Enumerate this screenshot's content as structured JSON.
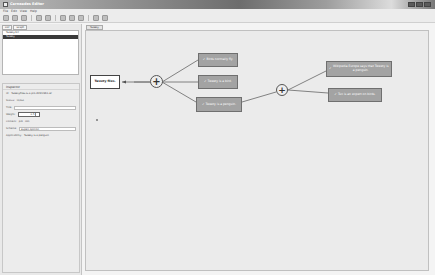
{
  "window": {
    "title": "Carneades Editor"
  },
  "menubar": {
    "items": [
      "File",
      "Edit",
      "View",
      "Help"
    ]
  },
  "toolbar": {
    "buttons": [
      "new-icon",
      "open-icon",
      "save-icon",
      "undo-icon",
      "redo-icon",
      "cut-icon",
      "copy-icon",
      "paste-icon",
      "zoom-in-icon",
      "zoom-out-icon"
    ]
  },
  "left_panel": {
    "tabs": [
      "Lkif",
      "Graph"
    ],
    "tree": [
      {
        "label": "Tweety.lkif",
        "selected": false
      },
      {
        "label": "Tweety",
        "selected": true
      }
    ]
  },
  "inspector": {
    "header": "Inspector",
    "id_label": "Id:",
    "id_value": "Tweetyflies-is-a-pro-d2bf23b1-ef",
    "status_label": "Status:",
    "status_value": "in/out",
    "title_label": "Title:",
    "title_value": "",
    "weight_label": "Weight:",
    "weight_value": "0.5",
    "content_label": "Content:",
    "content_pro": "pro",
    "content_con": "con",
    "scheme_label": "Scheme:",
    "scheme_value": "expert opinion",
    "applicability_label": "Applicability:",
    "applicability_value": "Tweety is a penguin"
  },
  "canvas": {
    "tab_label": "Tweety",
    "nodes": {
      "claim": "Tweety flies.",
      "premise1": "Birds normally fly.",
      "premise2": "Tweety is a bird.",
      "premise3": "Tweety is a penguin.",
      "premise4": "Wikipedia Europe says that Tweety is a penguin.",
      "premise5": "Tux is an expert on birds."
    },
    "check_glyph": "✓",
    "plus_glyph": "+"
  },
  "colors": {
    "canvas_bg": "#ebebeb",
    "premise_fill": "#a3a3a3",
    "claim_fill": "#ffffff",
    "selection": "#3a3a3a"
  }
}
